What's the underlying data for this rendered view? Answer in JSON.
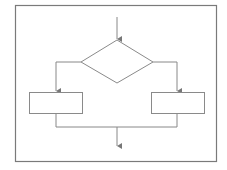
{
  "diagram": {
    "type": "flowchart",
    "colors": {
      "background": "#ffffff",
      "stroke": "#8a8a8a",
      "frame": "#7a7a7a"
    },
    "nodes": [
      {
        "id": "decision",
        "shape": "diamond",
        "label": ""
      },
      {
        "id": "left-process",
        "shape": "rectangle",
        "label": ""
      },
      {
        "id": "right-process",
        "shape": "rectangle",
        "label": ""
      }
    ],
    "edges": [
      {
        "from": "entry",
        "to": "decision"
      },
      {
        "from": "decision",
        "to": "left-process",
        "side": "left"
      },
      {
        "from": "decision",
        "to": "right-process",
        "side": "right"
      },
      {
        "from": "left-process",
        "to": "merge"
      },
      {
        "from": "right-process",
        "to": "merge"
      },
      {
        "from": "merge",
        "to": "exit"
      }
    ]
  }
}
